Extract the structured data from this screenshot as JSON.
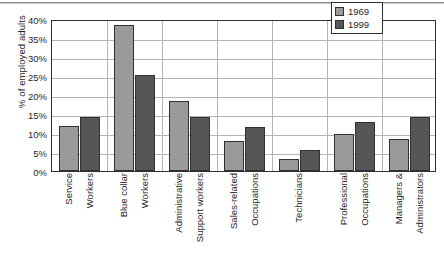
{
  "chart_data": {
    "type": "bar",
    "title": "",
    "subtitle": "",
    "xlabel": "",
    "ylabel": "% of employed adults",
    "ylim": [
      0,
      40
    ],
    "ytick_labels": [
      "40%",
      "35%",
      "30%",
      "25%",
      "20%",
      "15%",
      "10%",
      "5%",
      "0%"
    ],
    "ytick_values": [
      40,
      35,
      30,
      25,
      20,
      15,
      10,
      5,
      0
    ],
    "grid": "horizontal-and-category-separators",
    "legend_position": "top-right-inside",
    "categories": [
      "Service Workers",
      "Blue collar Workers",
      "Administrative Support workers",
      "Sales-related Occupations",
      "Technicians",
      "Professional Occupations",
      "Managers & Administrators"
    ],
    "category_label_lines": [
      [
        "Service",
        "Workers"
      ],
      [
        "Blue collar",
        "Workers"
      ],
      [
        "Administrative",
        "Support workers"
      ],
      [
        "Sales-related",
        "Occupations"
      ],
      [
        "Technicians"
      ],
      [
        "Professional",
        "Occupations"
      ],
      [
        "Managers &",
        "Administrators"
      ]
    ],
    "series": [
      {
        "name": "1969",
        "color": "#9a9a9a",
        "values": [
          11.8,
          38.3,
          18.3,
          7.8,
          3.2,
          9.8,
          8.5
        ]
      },
      {
        "name": "1999",
        "color": "#565656",
        "values": [
          14.3,
          25.3,
          14.3,
          11.7,
          5.4,
          12.9,
          14.1
        ]
      }
    ]
  },
  "legend": {
    "entries": [
      {
        "label": "1969",
        "color": "#9a9a9a"
      },
      {
        "label": "1999",
        "color": "#565656"
      }
    ]
  },
  "colors": {
    "series_1969": "#9a9a9a",
    "series_1999": "#565656",
    "axis": "#2f2f2f",
    "gridline": "#b4b4b4",
    "text": "#1f1f1f",
    "background": "#ffffff"
  }
}
